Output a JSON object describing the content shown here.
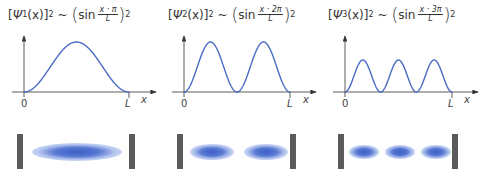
{
  "panels": [
    {
      "n": "1",
      "formula": {
        "lhs_psi": "Ψ",
        "lhs_sub": "1",
        "lhs_arg": "(x)",
        "lhs_pow": "2",
        "approx": "~",
        "sin": "sin",
        "num": "x · π",
        "den": "L",
        "pow": "2"
      },
      "axis": {
        "origin": "0",
        "end": "L",
        "x": "x"
      },
      "peaks": 1
    },
    {
      "n": "2",
      "formula": {
        "lhs_psi": "Ψ",
        "lhs_sub": "2",
        "lhs_arg": "(x)",
        "lhs_pow": "2",
        "approx": "~",
        "sin": "sin",
        "num": "x · 2π",
        "den": "L",
        "pow": "2"
      },
      "axis": {
        "origin": "0",
        "end": "L",
        "x": "x"
      },
      "peaks": 2
    },
    {
      "n": "3",
      "formula": {
        "lhs_psi": "Ψ",
        "lhs_sub": "3",
        "lhs_arg": "(x)",
        "lhs_pow": "2",
        "approx": "~",
        "sin": "sin",
        "num": "x · 3π",
        "den": "L",
        "pow": "2"
      },
      "axis": {
        "origin": "0",
        "end": "L",
        "x": "x"
      },
      "peaks": 3
    }
  ],
  "colors": {
    "curve": "#4a6bc4",
    "axis": "#333333",
    "wall": "#5a5a5a",
    "blob": "#3b5fc4"
  }
}
